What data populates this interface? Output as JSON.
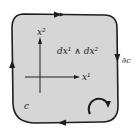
{
  "diagram": {
    "region_label": "c",
    "boundary_label": "∂c",
    "form_label": "dx¹ ∧ dx²",
    "axes": {
      "x_label": "x¹",
      "y_label": "x²"
    },
    "orientation": "counterclockwise-arrow-icon",
    "colors": {
      "fill": "#d6d6d6",
      "stroke": "#1e1e1e",
      "background": "#ffffff"
    }
  }
}
